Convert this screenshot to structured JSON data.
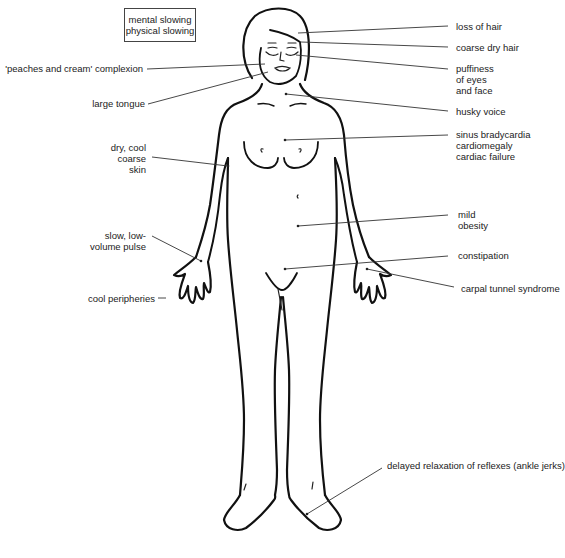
{
  "diagram": {
    "box": {
      "lines": [
        "mental slowing",
        "physical slowing"
      ]
    },
    "labels_right": [
      {
        "id": "loss-of-hair",
        "text": "loss of hair"
      },
      {
        "id": "coarse-dry-hair",
        "text": "coarse dry hair"
      },
      {
        "id": "puffiness",
        "text": "puffiness\nof eyes\nand face"
      },
      {
        "id": "husky-voice",
        "text": "husky voice"
      },
      {
        "id": "cardiac",
        "text": "sinus bradycardia\ncardiomegaly\ncardiac failure"
      },
      {
        "id": "mild-obesity",
        "text": "mild\nobesity"
      },
      {
        "id": "constipation",
        "text": "constipation"
      },
      {
        "id": "carpal-tunnel",
        "text": "carpal tunnel syndrome"
      },
      {
        "id": "delayed-reflexes",
        "text": "delayed relaxation of reflexes (ankle jerks)"
      }
    ],
    "labels_left": [
      {
        "id": "complexion",
        "text": "'peaches and cream' complexion"
      },
      {
        "id": "large-tongue",
        "text": "large tongue"
      },
      {
        "id": "dry-skin",
        "text": "dry, cool\ncoarse\nskin"
      },
      {
        "id": "pulse",
        "text": "slow, low-\nvolume pulse"
      },
      {
        "id": "cool-peripheries",
        "text": "cool peripheries"
      }
    ]
  }
}
